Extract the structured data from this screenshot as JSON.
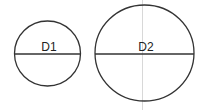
{
  "diagram": {
    "circles": [
      {
        "label": "D1",
        "cx": 47.5,
        "cy": 53.5,
        "rx": 33,
        "ry": 32.5
      },
      {
        "label": "D2",
        "cx": 144.5,
        "cy": 53,
        "rx": 49.5,
        "ry": 48
      }
    ],
    "colors": {
      "stroke": "#333333",
      "guide": "#d8d8d8",
      "background": "#ffffff"
    }
  }
}
